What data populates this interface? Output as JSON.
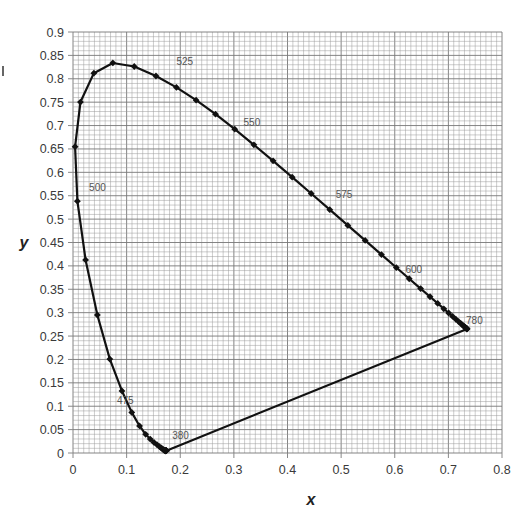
{
  "chart_data": {
    "type": "scatter",
    "title": "",
    "subtitle": "",
    "xlabel": "x",
    "ylabel": "y",
    "xlim": [
      0,
      0.8
    ],
    "ylim": [
      0,
      0.9
    ],
    "grid": true,
    "grid_minor_x_step": 0.01,
    "grid_minor_y_step": 0.01,
    "legend": "none",
    "x_ticks": [
      "0",
      "0.1",
      "0.2",
      "0.3",
      "0.4",
      "0.5",
      "0.6",
      "0.7",
      "0.8"
    ],
    "y_ticks": [
      "0",
      "0.05",
      "0.1",
      "0.15",
      "0.2",
      "0.25",
      "0.3",
      "0.35",
      "0.4",
      "0.45",
      "0.5",
      "0.55",
      "0.6",
      "0.65",
      "0.7",
      "0.75",
      "0.8",
      "0.85",
      "0.9"
    ],
    "series": [
      {
        "name": "Spectral locus (CIE 1931)",
        "line": true,
        "markers": "diamond",
        "closed_with_purple_line": true,
        "wavelengths": [
          380,
          385,
          390,
          395,
          400,
          405,
          410,
          415,
          420,
          425,
          430,
          435,
          440,
          445,
          450,
          455,
          460,
          465,
          470,
          475,
          480,
          485,
          490,
          495,
          500,
          505,
          510,
          515,
          520,
          525,
          530,
          535,
          540,
          545,
          550,
          555,
          560,
          565,
          570,
          575,
          580,
          585,
          590,
          595,
          600,
          605,
          610,
          615,
          620,
          625,
          630,
          635,
          640,
          645,
          650,
          655,
          660,
          665,
          670,
          675,
          680,
          685,
          690,
          695,
          700,
          780
        ],
        "x": [
          0.1741,
          0.174,
          0.1738,
          0.1736,
          0.1733,
          0.173,
          0.1726,
          0.1721,
          0.1714,
          0.1703,
          0.1689,
          0.1669,
          0.1644,
          0.1611,
          0.1566,
          0.151,
          0.144,
          0.1355,
          0.1241,
          0.1096,
          0.0913,
          0.0687,
          0.0454,
          0.0235,
          0.0082,
          0.0039,
          0.0139,
          0.0389,
          0.0743,
          0.1142,
          0.1547,
          0.1929,
          0.2296,
          0.2658,
          0.3016,
          0.3373,
          0.3731,
          0.4087,
          0.4441,
          0.4788,
          0.5125,
          0.5448,
          0.5752,
          0.6029,
          0.627,
          0.6482,
          0.6658,
          0.6801,
          0.6915,
          0.7006,
          0.7079,
          0.714,
          0.719,
          0.723,
          0.726,
          0.7283,
          0.73,
          0.7311,
          0.732,
          0.7327,
          0.7334,
          0.734,
          0.7344,
          0.7346,
          0.7347,
          0.7347
        ],
        "y": [
          0.005,
          0.005,
          0.0049,
          0.0049,
          0.0048,
          0.0048,
          0.0048,
          0.0048,
          0.0051,
          0.0058,
          0.0069,
          0.0086,
          0.0109,
          0.0138,
          0.0177,
          0.0227,
          0.0297,
          0.0399,
          0.0578,
          0.0868,
          0.1327,
          0.2007,
          0.295,
          0.4127,
          0.5384,
          0.6548,
          0.7502,
          0.812,
          0.8338,
          0.8262,
          0.8059,
          0.7816,
          0.7543,
          0.7243,
          0.6923,
          0.6589,
          0.6245,
          0.5896,
          0.5547,
          0.5202,
          0.4866,
          0.4544,
          0.4242,
          0.3965,
          0.3725,
          0.3514,
          0.334,
          0.3197,
          0.3083,
          0.2993,
          0.292,
          0.2859,
          0.2809,
          0.277,
          0.274,
          0.2717,
          0.27,
          0.2689,
          0.268,
          0.2673,
          0.2666,
          0.266,
          0.2656,
          0.2654,
          0.2653,
          0.2653
        ]
      }
    ],
    "annotations": [
      {
        "text": "380",
        "x": 0.185,
        "y": 0.03
      },
      {
        "text": "475",
        "x": 0.082,
        "y": 0.105
      },
      {
        "text": "500",
        "x": 0.03,
        "y": 0.56
      },
      {
        "text": "525",
        "x": 0.193,
        "y": 0.83
      },
      {
        "text": "550",
        "x": 0.318,
        "y": 0.7
      },
      {
        "text": "575",
        "x": 0.49,
        "y": 0.545
      },
      {
        "text": "600",
        "x": 0.62,
        "y": 0.385
      },
      {
        "text": "780",
        "x": 0.733,
        "y": 0.276
      }
    ],
    "colors": {
      "curve": "#111111",
      "grid_minor": "#9a9a9a",
      "grid_major": "#777777",
      "tick_text": "#3a3a3a",
      "label_text": "#555555"
    }
  }
}
